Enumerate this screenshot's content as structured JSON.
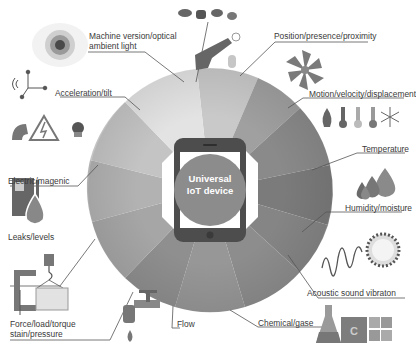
{
  "diagram": {
    "center_label_line1": "Universal",
    "center_label_line2": "IoT device",
    "center_icon": "smartphone-icon",
    "sensor_categories": [
      {
        "id": "machine-vision",
        "label_line1": "Machine version/optical",
        "label_line2": "ambient light",
        "icon": "eye-lens-icon"
      },
      {
        "id": "acceleration",
        "label": "Acceleration/tilt",
        "icon": "axis-accelerometer-icon"
      },
      {
        "id": "electric",
        "label": "Electric/magenic",
        "icon": "magnet-high-voltage-icon"
      },
      {
        "id": "leaks",
        "label": "Leaks/levels",
        "icon": "fuel-pump-drop-icon"
      },
      {
        "id": "force",
        "label_line1": "Force/load/torque",
        "label_line2": "stain/pressure",
        "icon": "clamp-crane-load-icon"
      },
      {
        "id": "flow",
        "label": "Flow",
        "icon": "water-tap-icon"
      },
      {
        "id": "chemical",
        "label": "Chemical/gase",
        "icon": "flask-periodic-table-icon"
      },
      {
        "id": "acoustic",
        "label": "Acoustic sound vibraton",
        "icon": "sound-wave-burst-icon"
      },
      {
        "id": "humidity",
        "label": "Humidity/moisture",
        "icon": "water-drops-icon"
      },
      {
        "id": "temperature",
        "label": "Temperature",
        "icon": "thermometers-snowflake-icon"
      },
      {
        "id": "motion",
        "label": "Motion/velocity/displacement",
        "icon": "fan-propeller-icon"
      },
      {
        "id": "position",
        "label": "Position/presence/proximity",
        "icon": "touch-hand-cameras-icon"
      }
    ],
    "colors": {
      "ring_light": "#e6e6e6",
      "ring_mid": "#a8a8a8",
      "ring_dark": "#6a6a6a",
      "phone_body": "#4a4a4a",
      "leader_line": "#555555"
    }
  }
}
